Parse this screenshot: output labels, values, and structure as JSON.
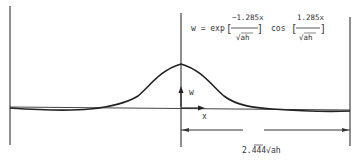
{
  "figure": {
    "formula": {
      "lhs": "w = exp",
      "frac1_num": "−1.285x",
      "frac1_den": "√ah",
      "mid": "cos",
      "frac2_num": "1.285x",
      "frac2_den": "√ah",
      "open_bracket": "[",
      "close_bracket": "]"
    },
    "axis_labels": {
      "vertical": "w",
      "horizontal": "x"
    },
    "dimension_label": "2.444√ah",
    "colors": {
      "ink": "#333333",
      "background": "#ffffff"
    }
  }
}
